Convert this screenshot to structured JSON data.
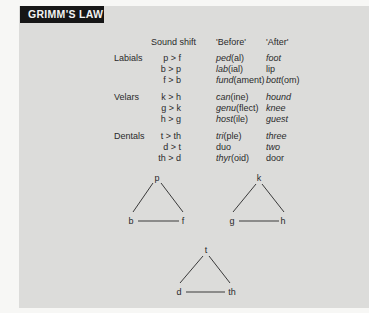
{
  "title": "GRIMM'S LAW",
  "headers": {
    "sound_shift": "Sound shift",
    "before": "'Before'",
    "after": "'After'"
  },
  "groups": [
    {
      "name": "Labials",
      "rows": [
        {
          "shift": "p > f",
          "before_root": "ped",
          "before_rest": "(al)",
          "after_root": "foot",
          "after_rest": ""
        },
        {
          "shift": "b > p",
          "before_root": "lab",
          "before_rest": "(ial)",
          "after_root": "lip",
          "after_rest": ""
        },
        {
          "shift": "f > b",
          "before_root": "fund",
          "before_rest": "(ament)",
          "after_root": "bott",
          "after_rest": "(om)"
        }
      ]
    },
    {
      "name": "Velars",
      "rows": [
        {
          "shift": "k > h",
          "before_root": "can",
          "before_rest": "(ine)",
          "after_root": "hound",
          "after_rest": ""
        },
        {
          "shift": "g > k",
          "before_root": "genu",
          "before_rest": "(flect)",
          "after_root": "knee",
          "after_rest": ""
        },
        {
          "shift": "h > g",
          "before_root": "host",
          "before_rest": "(ile)",
          "after_root": "guest",
          "after_rest": ""
        }
      ]
    },
    {
      "name": "Dentals",
      "rows": [
        {
          "shift": "t > th",
          "before_root": "tri",
          "before_rest": "(ple)",
          "after_root": "three",
          "after_rest": ""
        },
        {
          "shift": "d > t",
          "before_root": "duo",
          "before_rest": "",
          "after_root": "two",
          "after_rest": ""
        },
        {
          "shift": "th > d",
          "before_root": "thyr",
          "before_rest": "(oid)",
          "after_root": "door",
          "after_rest": ""
        }
      ]
    }
  ],
  "triangles": [
    {
      "top": "p",
      "left": "b",
      "right": "f"
    },
    {
      "top": "k",
      "left": "g",
      "right": "h"
    },
    {
      "top": "t",
      "left": "d",
      "right": "th"
    }
  ]
}
